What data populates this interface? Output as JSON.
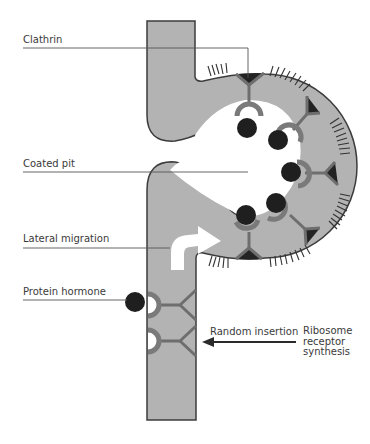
{
  "labels": {
    "clathrin": "Clathrin",
    "coated_pit": "Coated pit",
    "lateral_migration": "Lateral migration",
    "protein_hormone": "Protein hormone",
    "random_insertion": "Random insertion",
    "ribosome_synthesis": "Ribosome\nreceptor\nsynthesis"
  },
  "colors": {
    "membrane_fill": "#b3b3b3",
    "membrane_stroke": "#3c3c3c",
    "receptor": "#7a7a7a",
    "hormone": "#1f1f1f",
    "clathrin_triangle": "#232323",
    "leader_line": "#555555",
    "arrow_white": "#ffffff",
    "background": "#ffffff"
  }
}
